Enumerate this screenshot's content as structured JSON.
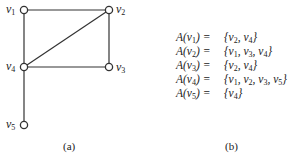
{
  "figure_a": {
    "caption": "(a)",
    "vertices": [
      {
        "id": "v1",
        "base": "v",
        "sub": "1",
        "x": 24,
        "y": 10
      },
      {
        "id": "v2",
        "base": "v",
        "sub": "2",
        "x": 109,
        "y": 10
      },
      {
        "id": "v3",
        "base": "v",
        "sub": "3",
        "x": 109,
        "y": 67
      },
      {
        "id": "v4",
        "base": "v",
        "sub": "4",
        "x": 24,
        "y": 67
      },
      {
        "id": "v5",
        "base": "v",
        "sub": "5",
        "x": 24,
        "y": 125
      }
    ],
    "edges": [
      [
        "v1",
        "v2"
      ],
      [
        "v1",
        "v4"
      ],
      [
        "v2",
        "v4"
      ],
      [
        "v2",
        "v3"
      ],
      [
        "v3",
        "v4"
      ],
      [
        "v4",
        "v5"
      ]
    ],
    "colors": {
      "stroke": "#333333",
      "fill": "#ffffff"
    }
  },
  "figure_b": {
    "caption": "(b)",
    "rows": [
      {
        "lhs": "A(v1) =",
        "rhs": "{v2, v4}"
      },
      {
        "lhs": "A(v2) =",
        "rhs": "{v1, v3, v4}"
      },
      {
        "lhs": "A(v3) =",
        "rhs": "{v2, v4}"
      },
      {
        "lhs": "A(v4) =",
        "rhs": "{v1, v2, v3, v5}"
      },
      {
        "lhs": "A(v5) =",
        "rhs": "{v4}"
      }
    ]
  }
}
